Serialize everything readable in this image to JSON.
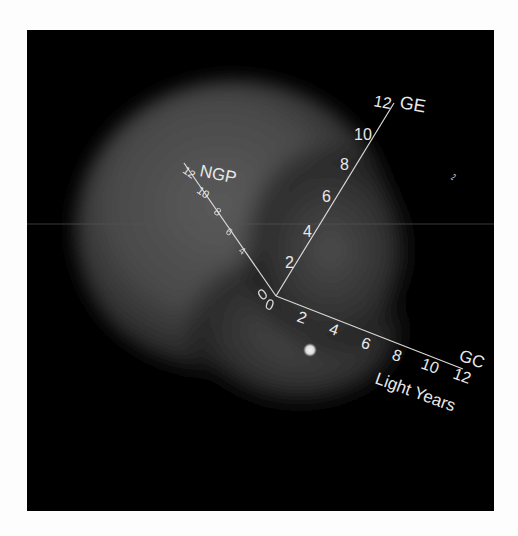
{
  "figure": {
    "background": "#000000",
    "page_background": "#fdfdfd",
    "axis_color": "#d8d8d8",
    "cloud_color": "#6a6a6a",
    "star_color": "#e0e0e0"
  },
  "axes": {
    "origin_label": "0",
    "ge": {
      "name": "GE",
      "ticks": [
        "2",
        "4",
        "6",
        "8",
        "10",
        "12"
      ]
    },
    "ngp": {
      "name": "NGP",
      "ticks": [
        "2",
        "4",
        "6",
        "8",
        "10",
        "12"
      ]
    },
    "gc": {
      "name": "GC",
      "ticks": [
        "2",
        "4",
        "6",
        "8",
        "10",
        "12"
      ]
    }
  },
  "units_label": "Light Years",
  "star": {
    "label": ""
  }
}
